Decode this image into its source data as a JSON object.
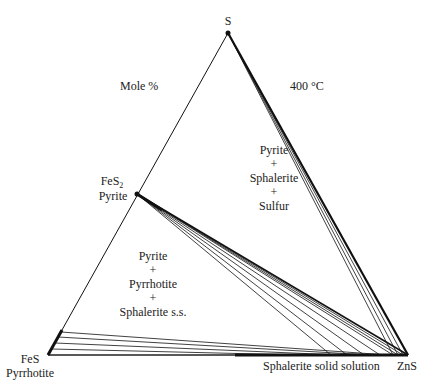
{
  "diagram": {
    "type": "ternary-phase-diagram",
    "header_left": "Mole %",
    "header_right": "400 °C",
    "vertices": {
      "top": {
        "label": "S"
      },
      "left": {
        "formula": "FeS",
        "mineral": "Pyrrhotite"
      },
      "right": {
        "label": "ZnS"
      }
    },
    "pyrite_point": {
      "formula_base": "FeS",
      "formula_sub": "2",
      "mineral": "Pyrite"
    },
    "fields": {
      "upper": [
        "Pyrite",
        "+",
        "Sphalerite",
        "+",
        "Sulfur"
      ],
      "lower": [
        "Pyrite",
        "+",
        "Pyrrhotite",
        "+",
        "Sphalerite s.s."
      ]
    },
    "base_label": "Sphalerite solid solution",
    "colors": {
      "line": "#111111",
      "text": "#222222",
      "background": "#ffffff"
    }
  }
}
